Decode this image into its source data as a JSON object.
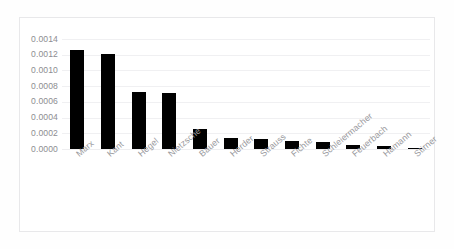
{
  "chart_data": {
    "type": "bar",
    "title": "",
    "subtitle": "",
    "xlabel": "",
    "ylabel": "",
    "categories": [
      "Marx",
      "Kant",
      "Hegel",
      "Nietzsche",
      "Bauer",
      "Herder",
      "Strauss",
      "Fichte",
      "Schleiermacher",
      "Feuerbach",
      "Hamann",
      "Stirner"
    ],
    "values": [
      0.00126,
      0.00121,
      0.00072,
      0.00071,
      0.00026,
      0.00014,
      0.000125,
      0.0001,
      9e-05,
      4.7e-05,
      4e-05,
      1.5e-05
    ],
    "series": [
      {
        "name": "",
        "values": [
          0.00126,
          0.00121,
          0.00072,
          0.00071,
          0.00026,
          0.00014,
          0.000125,
          0.0001,
          9e-05,
          4.7e-05,
          4e-05,
          1.5e-05
        ]
      }
    ],
    "ylim": [
      0.0,
      0.0014
    ],
    "ytick_labels": [
      "0.0014",
      "0.0012",
      "0.0010",
      "0.0008",
      "0.0006",
      "0.0004",
      "0.0002",
      "0.0000"
    ],
    "ytick_values": [
      0.0014,
      0.0012,
      0.001,
      0.0008,
      0.0006,
      0.0004,
      0.0002,
      0.0
    ],
    "grid": true,
    "grid_axis": "y",
    "legend": false,
    "legend_position": "none",
    "bar_color": "#000000",
    "grid_color": "#f0f0f2",
    "tick_label_color": "#8d8d91",
    "category_label_color": "#9a9a9e",
    "category_label_rotation": -40,
    "plot_background": "#ffffff",
    "frame_border_color": "#e8e8ea",
    "annotations": []
  }
}
